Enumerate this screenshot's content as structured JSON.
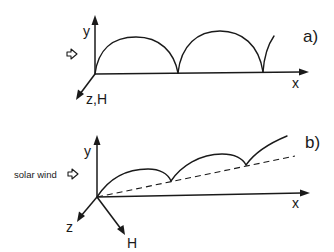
{
  "figure": {
    "panels": [
      {
        "id": "a",
        "label": "a)",
        "axes": {
          "x": "x",
          "y": "y",
          "z": "z,H"
        },
        "inflow_label": "",
        "trajectory": "cycloid arcs along x-axis (cusps on x-axis)"
      },
      {
        "id": "b",
        "label": "b)",
        "axes": {
          "x": "x",
          "y": "y",
          "z": "z",
          "extra": "H"
        },
        "inflow_label": "solar wind",
        "trajectory": "cycloid arcs drifting along dashed line inclined to x-axis"
      }
    ]
  },
  "colors": {
    "ink": "#1a1a1a",
    "background": "#ffffff"
  }
}
